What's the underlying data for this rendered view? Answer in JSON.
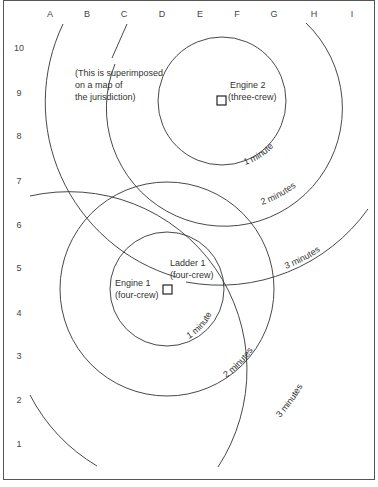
{
  "columns": [
    "A",
    "B",
    "C",
    "D",
    "E",
    "F",
    "G",
    "H",
    "I"
  ],
  "rows": [
    "10",
    "9",
    "8",
    "7",
    "6",
    "5",
    "4",
    "3",
    "2",
    "1"
  ],
  "note": [
    "(This is superimposed",
    "on a map of",
    "the jurisdiction)"
  ],
  "units": [
    {
      "name": "Engine 2",
      "crew": "(three-crew)"
    },
    {
      "name": "Engine 1",
      "crew": "(four-crew)"
    },
    {
      "name": "Ladder 1",
      "crew": "(four-crew)"
    }
  ],
  "ring_labels": {
    "e2_1": "1 minute",
    "e2_2": "2 minutes",
    "e2_3": "3 minutes",
    "e1_1": "1 minute",
    "e1_2": "2 minutes",
    "e1_3": "3 minutes"
  },
  "colors": {
    "line": "#333333",
    "frame": "#555555",
    "background": "#ffffff"
  }
}
